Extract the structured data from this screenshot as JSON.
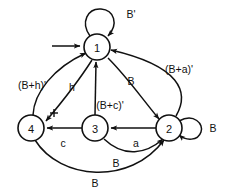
{
  "diagram": {
    "type": "finite-state-machine",
    "stroke_color": "#111111",
    "background_color": "#ffffff",
    "states": [
      {
        "id": "1",
        "label": "1",
        "cx": 97,
        "cy": 47,
        "r": 13,
        "initial": true
      },
      {
        "id": "2",
        "label": "2",
        "cx": 169,
        "cy": 128,
        "r": 13,
        "initial": false
      },
      {
        "id": "3",
        "label": "3",
        "cx": 95,
        "cy": 128,
        "r": 13,
        "initial": false
      },
      {
        "id": "4",
        "label": "4",
        "cx": 31,
        "cy": 128,
        "r": 13,
        "initial": false
      }
    ],
    "start_arrow": {
      "name": "initial-state-arrow",
      "target": "1",
      "from_x": 52,
      "to_x": 82,
      "y": 46
    },
    "transitions": [
      {
        "id": "t1",
        "from": "1",
        "to": "1",
        "label": "B'",
        "kind": "self-loop-top",
        "label_x": 131,
        "label_y": 14
      },
      {
        "id": "t2",
        "from": "2",
        "to": "2",
        "label": "B",
        "kind": "self-loop-right",
        "label_x": 213,
        "label_y": 128
      },
      {
        "id": "t3",
        "from": "1",
        "to": "2",
        "label": "B",
        "kind": "arc",
        "label_x": 131,
        "label_y": 81
      },
      {
        "id": "t4",
        "from": "2",
        "to": "1",
        "label": "(B+a)'",
        "kind": "arc",
        "label_x": 179,
        "label_y": 69
      },
      {
        "id": "t5",
        "from": "3",
        "to": "1",
        "label": "(B+c)'",
        "kind": "straight",
        "label_x": 110,
        "label_y": 105
      },
      {
        "id": "t6",
        "from": "4",
        "to": "1",
        "label": "(B+h)'",
        "kind": "arc",
        "label_x": 32,
        "label_y": 85
      },
      {
        "id": "t7",
        "from": "1",
        "to": "4",
        "label": "h",
        "kind": "arc",
        "label_x": 72,
        "label_y": 87
      },
      {
        "id": "t8",
        "from": "3",
        "to": "4",
        "label": "c",
        "kind": "straight",
        "label_x": 63,
        "label_y": 143
      },
      {
        "id": "t9",
        "from": "2",
        "to": "3",
        "label": "a",
        "kind": "straight",
        "label_x": 136,
        "label_y": 143
      },
      {
        "id": "t10",
        "from": "3",
        "to": "2",
        "label": "B",
        "kind": "arc-bottom",
        "label_x": 116,
        "label_y": 163
      },
      {
        "id": "t11",
        "from": "4",
        "to": "2",
        "label": "B",
        "kind": "arc-bottom-outer",
        "label_x": 95,
        "label_y": 183
      }
    ],
    "annotations": [
      {
        "id": "a1",
        "name": "arc-crossing-tick",
        "x": 54,
        "y": 113,
        "glyph": "+"
      }
    ]
  }
}
